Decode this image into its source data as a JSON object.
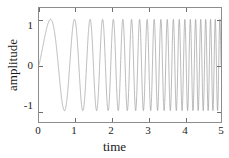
{
  "chart_data": {
    "type": "line",
    "title": "",
    "xlabel": "time",
    "ylabel": "amplitude",
    "xlim": [
      0,
      5
    ],
    "ylim": [
      -1.25,
      1.25
    ],
    "grid": false,
    "legend": null,
    "xticks": [
      0,
      1,
      2,
      3,
      4,
      5
    ],
    "xticklabels": [
      "0",
      "1",
      "2",
      "3",
      "4",
      "5"
    ],
    "yticks": [
      -1,
      0,
      1
    ],
    "yticklabels": [
      "-1",
      "0",
      "1"
    ],
    "series": [
      {
        "name": "chirp",
        "description": "linear frequency chirp, unit amplitude sinusoid whose instantaneous frequency increases with time",
        "color": "#8c8c8c",
        "linewidth": 0.6,
        "formula": "y(t) = sin(2*pi*(f0*t + 0.5*k*t*t))",
        "f0": 0.55,
        "k": 1.5,
        "samples": 4000,
        "amplitude": 1.0,
        "t_start": 0,
        "t_end": 5,
        "notable_points": [
          {
            "t": 0.0,
            "y": 0.0
          },
          {
            "t": 0.45,
            "y": 1.0
          },
          {
            "t": 0.85,
            "y": -1.0
          },
          {
            "t": 1.1,
            "y": 1.0
          },
          {
            "t": 1.42,
            "y": 1.0
          },
          {
            "t": 2.0,
            "y": 1.0
          },
          {
            "t": 3.0,
            "y": 1.0
          },
          {
            "t": 4.0,
            "y": 1.0
          },
          {
            "t": 5.0,
            "y": 1.0
          }
        ]
      }
    ]
  },
  "axes": {
    "xlabel": "time",
    "ylabel": "amplitude",
    "xticklabels": [
      "0",
      "1",
      "2",
      "3",
      "4",
      "5"
    ],
    "yticklabels": [
      "1",
      "0",
      "-1"
    ],
    "frame_color": "#8d8d8d",
    "background": "#ffffff"
  }
}
